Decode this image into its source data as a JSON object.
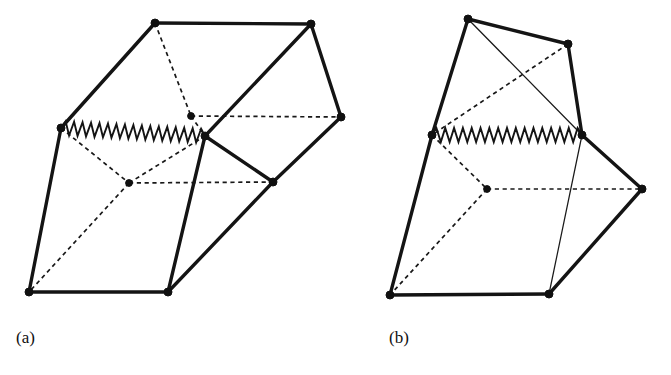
{
  "figure": {
    "background_color": "#ffffff",
    "ink_color": "#141414",
    "panels": [
      {
        "id": "panel-a",
        "label": "(a)",
        "label_position": {
          "x": 16,
          "y": 343
        },
        "description": "Left polyhedral mechanism diagram with zigzag spring and hidden dotted edges",
        "vertices": [
          {
            "name": "a-top-left",
            "x": 155,
            "y": 23,
            "style": "solid"
          },
          {
            "name": "a-top-right",
            "x": 311,
            "y": 24,
            "style": "solid"
          },
          {
            "name": "a-left-mid",
            "x": 61,
            "y": 128,
            "style": "solid"
          },
          {
            "name": "a-inner-upper",
            "x": 191,
            "y": 116,
            "style": "hidden"
          },
          {
            "name": "a-center-right",
            "x": 205,
            "y": 136,
            "style": "solid"
          },
          {
            "name": "a-right-mid",
            "x": 341,
            "y": 117,
            "style": "solid"
          },
          {
            "name": "a-inner-center",
            "x": 129,
            "y": 183,
            "style": "hidden"
          },
          {
            "name": "a-right-lower",
            "x": 273,
            "y": 182,
            "style": "solid"
          },
          {
            "name": "a-bottom-left",
            "x": 29,
            "y": 292,
            "style": "solid"
          },
          {
            "name": "a-bottom-mid",
            "x": 168,
            "y": 292,
            "style": "solid"
          }
        ],
        "solid_edges": [
          [
            "a-top-left",
            "a-top-right"
          ],
          [
            "a-top-left",
            "a-left-mid"
          ],
          [
            "a-top-right",
            "a-center-right"
          ],
          [
            "a-top-right",
            "a-right-mid"
          ],
          [
            "a-right-mid",
            "a-right-lower"
          ],
          [
            "a-center-right",
            "a-right-lower"
          ],
          [
            "a-center-right",
            "a-bottom-mid"
          ],
          [
            "a-left-mid",
            "a-bottom-left"
          ],
          [
            "a-bottom-left",
            "a-bottom-mid"
          ],
          [
            "a-bottom-mid",
            "a-right-lower"
          ]
        ],
        "dashed_edges": [
          [
            "a-top-left",
            "a-inner-upper"
          ],
          [
            "a-inner-upper",
            "a-right-mid"
          ],
          [
            "a-inner-upper",
            "a-center-right"
          ],
          [
            "a-left-mid",
            "a-inner-center"
          ],
          [
            "a-inner-center",
            "a-right-lower"
          ],
          [
            "a-inner-center",
            "a-bottom-left"
          ],
          [
            "a-inner-center",
            "a-center-right"
          ]
        ],
        "zigzag": {
          "name": "a-spring",
          "from": "a-left-mid",
          "to": "a-center-right",
          "teeth": 17,
          "amplitude": 7
        }
      },
      {
        "id": "panel-b",
        "label": "(b)",
        "label_position": {
          "x": 389,
          "y": 343
        },
        "description": "Right polyhedral mechanism diagram in folded state with zigzag spring",
        "vertices": [
          {
            "name": "b-top",
            "x": 468,
            "y": 19,
            "style": "solid"
          },
          {
            "name": "b-top-right",
            "x": 568,
            "y": 44,
            "style": "solid"
          },
          {
            "name": "b-left-mid",
            "x": 432,
            "y": 135,
            "style": "solid"
          },
          {
            "name": "b-center-right",
            "x": 582,
            "y": 135,
            "style": "solid"
          },
          {
            "name": "b-right",
            "x": 642,
            "y": 189,
            "style": "solid"
          },
          {
            "name": "b-inner-center",
            "x": 487,
            "y": 189,
            "style": "hidden"
          },
          {
            "name": "b-bottom-left",
            "x": 390,
            "y": 295,
            "style": "solid"
          },
          {
            "name": "b-bottom-right",
            "x": 549,
            "y": 294,
            "style": "solid"
          }
        ],
        "solid_edges": [
          [
            "b-top",
            "b-top-right"
          ],
          [
            "b-top",
            "b-left-mid"
          ],
          [
            "b-top-right",
            "b-center-right"
          ],
          [
            "b-center-right",
            "b-right"
          ],
          [
            "b-left-mid",
            "b-bottom-left"
          ],
          [
            "b-bottom-left",
            "b-bottom-right"
          ],
          [
            "b-bottom-right",
            "b-right"
          ]
        ],
        "thin_edges": [
          [
            "b-top",
            "b-center-right"
          ],
          [
            "b-center-right",
            "b-bottom-right"
          ]
        ],
        "dashed_edges": [
          [
            "b-top-right",
            "b-left-mid"
          ],
          [
            "b-left-mid",
            "b-inner-center"
          ],
          [
            "b-inner-center",
            "b-right"
          ],
          [
            "b-inner-center",
            "b-bottom-left"
          ]
        ],
        "zigzag": {
          "name": "b-spring",
          "from": "b-left-mid",
          "to": "b-center-right",
          "teeth": 17,
          "amplitude": 7
        }
      }
    ]
  }
}
